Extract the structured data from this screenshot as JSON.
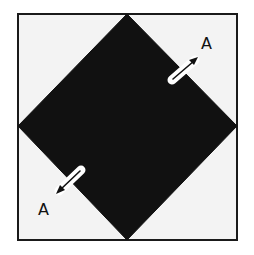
{
  "figure": {
    "type": "quilt-block-diagram",
    "colors": {
      "background": "#f3f3f3",
      "border": "#1a1a1a",
      "diamond": "#111111",
      "arrow_fill": "#ffffff",
      "arrow_stroke": "#111111"
    },
    "outer_square": {
      "x": 18,
      "y": 14,
      "width": 219,
      "height": 226
    },
    "diamond": {
      "points": [
        [
          127,
          14
        ],
        [
          237,
          126
        ],
        [
          127,
          240
        ],
        [
          18,
          126
        ]
      ]
    },
    "labels": [
      {
        "id": "label-top-right",
        "text": "A",
        "x": 201,
        "y": 49
      },
      {
        "id": "label-bottom-left",
        "text": "A",
        "x": 38,
        "y": 215
      }
    ],
    "arrows": [
      {
        "id": "arrow-top-right",
        "direction": "up-right"
      },
      {
        "id": "arrow-bottom-left",
        "direction": "down-left"
      }
    ]
  }
}
